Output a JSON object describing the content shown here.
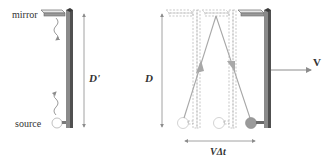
{
  "left_diagram": {
    "mirror_label": "mirror",
    "source_label": "source",
    "distance_label": "D'"
  },
  "right_diagram": {
    "distance_label": "D",
    "velocity_label": "V",
    "displacement_label": "VΔt"
  },
  "colors": {
    "wall_dark": "#5a5a5a",
    "wall_light": "#8a8a8a",
    "light_path": "#a8a8a8",
    "arrow": "#8c8c8c",
    "ghost": "#b0b0b0",
    "source_fill": "#9a9a9a"
  }
}
